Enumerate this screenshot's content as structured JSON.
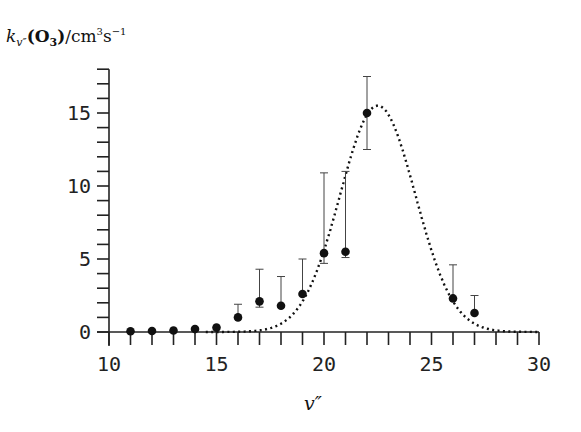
{
  "chart_data": {
    "type": "scatter",
    "title": "",
    "ylabel_parts": {
      "k": "k",
      "sub": "v″",
      "species": "(O",
      "species_sub": "3",
      "close": ")",
      "unit": "/cm",
      "unit_sup1": "3",
      "unit_s": "s",
      "unit_sup2": "−1"
    },
    "ylabel": "k_v″(O3) / cm^3 s^-1",
    "xlabel": "v″",
    "xlim": [
      10,
      30
    ],
    "ylim": [
      0,
      18
    ],
    "xticks": [
      10,
      15,
      20,
      25,
      30
    ],
    "yticks": [
      0,
      5,
      10,
      15
    ],
    "x_minor_step": 1,
    "y_minor_step": 1,
    "grid": false,
    "series": [
      {
        "name": "measured",
        "style": "filled-circle-with-errorbars",
        "x": [
          11,
          12,
          13,
          14,
          15,
          16,
          17,
          18,
          19,
          20,
          21,
          22,
          26,
          27
        ],
        "values": [
          0.05,
          0.07,
          0.1,
          0.2,
          0.3,
          1.0,
          2.1,
          1.8,
          2.6,
          5.4,
          5.5,
          15.0,
          2.3,
          1.3
        ],
        "err_low": [
          null,
          null,
          null,
          null,
          null,
          null,
          1.7,
          null,
          null,
          4.7,
          5.1,
          12.5,
          null,
          null
        ],
        "err_high": [
          null,
          null,
          null,
          null,
          null,
          1.9,
          4.3,
          3.8,
          5.0,
          10.9,
          11.0,
          17.5,
          4.6,
          2.5
        ]
      },
      {
        "name": "fit",
        "style": "dotted-line",
        "function": "gaussian",
        "amplitude": 15.5,
        "center": 22.5,
        "sigma": 1.75
      }
    ]
  }
}
